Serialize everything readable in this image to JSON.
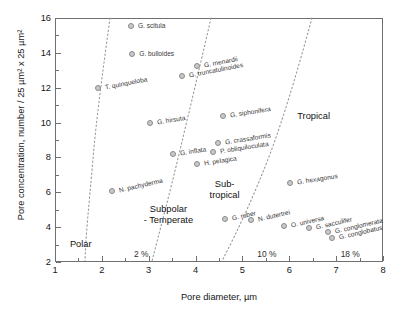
{
  "chart_data": {
    "type": "scatter",
    "title": "",
    "xlabel": "Pore diameter, µm",
    "ylabel": "Pore concentration, number / 25 µm² x 25 µm²",
    "xlim": [
      1,
      8
    ],
    "ylim": [
      2,
      16
    ],
    "xticks": [
      1,
      2,
      3,
      4,
      5,
      6,
      7,
      8
    ],
    "yticks": [
      2,
      4,
      6,
      8,
      10,
      12,
      14,
      16
    ],
    "xtick_labels": [
      "1",
      "2",
      "3",
      "4",
      "5",
      "6",
      "7",
      "8"
    ],
    "ytick_labels": [
      "2",
      "4",
      "6",
      "8",
      "10",
      "12",
      "14",
      "16"
    ],
    "grid": false,
    "legend": "none",
    "points": [
      {
        "label": "G. scitula",
        "x": 2.62,
        "y": 15.55,
        "lx": 7,
        "ly": -1,
        "rot": 0
      },
      {
        "label": "G. bulloides",
        "x": 2.65,
        "y": 13.95,
        "lx": 7,
        "ly": -1,
        "rot": 0
      },
      {
        "label": "G. menardii",
        "x": 4.02,
        "y": 13.25,
        "lx": 7,
        "ly": -1,
        "rot": -11
      },
      {
        "label": "G. truncatulinoides",
        "x": 3.72,
        "y": 12.65,
        "lx": 7,
        "ly": -1,
        "rot": -11
      },
      {
        "label": "T. quinqueloba",
        "x": 1.92,
        "y": 12.0,
        "lx": 7,
        "ly": -1,
        "rot": -11
      },
      {
        "label": "G. siphonifera",
        "x": 4.58,
        "y": 10.35,
        "lx": 7,
        "ly": -1,
        "rot": -9
      },
      {
        "label": "G. hirsuta",
        "x": 3.02,
        "y": 10.0,
        "lx": 7,
        "ly": -1,
        "rot": -9
      },
      {
        "label": "G. crassaformis",
        "x": 4.48,
        "y": 8.85,
        "lx": 7,
        "ly": -1,
        "rot": -9
      },
      {
        "label": "P. obliquiloculata",
        "x": 4.38,
        "y": 8.3,
        "lx": 7,
        "ly": -1,
        "rot": -9
      },
      {
        "label": "G. inflata",
        "x": 3.52,
        "y": 8.2,
        "lx": 7,
        "ly": -1,
        "rot": -9
      },
      {
        "label": "H. pelagica",
        "x": 4.02,
        "y": 7.6,
        "lx": 7,
        "ly": -1,
        "rot": -9
      },
      {
        "label": "G. hexagonus",
        "x": 6.02,
        "y": 6.55,
        "lx": 7,
        "ly": -1,
        "rot": -9
      },
      {
        "label": "N. pachyderma",
        "x": 2.22,
        "y": 6.1,
        "lx": 7,
        "ly": -1,
        "rot": -13
      },
      {
        "label": "G. ruber",
        "x": 4.62,
        "y": 4.45,
        "lx": 7,
        "ly": -1,
        "rot": -13
      },
      {
        "label": "N. dutertrei",
        "x": 5.18,
        "y": 4.4,
        "lx": 7,
        "ly": -1,
        "rot": -13
      },
      {
        "label": "O. universa",
        "x": 5.88,
        "y": 4.05,
        "lx": 7,
        "ly": -1,
        "rot": -13
      },
      {
        "label": "G. sacculifer",
        "x": 6.42,
        "y": 3.95,
        "lx": 7,
        "ly": -1,
        "rot": -13
      },
      {
        "label": "G. conglomerata",
        "x": 6.82,
        "y": 3.75,
        "lx": 7,
        "ly": -1,
        "rot": -13
      },
      {
        "label": "G. conglobatus",
        "x": 6.92,
        "y": 3.35,
        "lx": 7,
        "ly": -1,
        "rot": -13
      }
    ],
    "isolines": [
      {
        "name": "2 %",
        "label": "2 %",
        "label_x": 2.84,
        "label_y": 2.45
      },
      {
        "name": "10 %",
        "label": "10 %",
        "label_x": 5.52,
        "label_y": 2.45
      },
      {
        "name": "18 %",
        "label": "18 %",
        "label_x": 7.3,
        "label_y": 2.45
      }
    ],
    "regions": [
      {
        "name": "polar",
        "text": "Polar",
        "x": 1.55,
        "y": 3.05
      },
      {
        "name": "subpolar-temperate",
        "text": "Subpolar\n- Temperate",
        "x": 3.42,
        "y": 4.72
      },
      {
        "name": "sub-tropical",
        "text": "Sub-\ntropical",
        "x": 4.62,
        "y": 6.15
      },
      {
        "name": "tropical",
        "text": "Tropical",
        "x": 6.52,
        "y": 10.35
      }
    ],
    "colors": {
      "axis": "#6f6f6f",
      "text": "#161616",
      "marker_fill": "#c9c9c9",
      "marker_edge": "#8a8a8a",
      "isoline": "#9a9a9a"
    }
  }
}
